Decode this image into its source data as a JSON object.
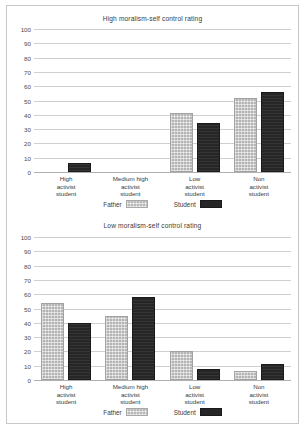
{
  "page": {
    "background_color": "#ffffff",
    "border_color": "#c8c8c8"
  },
  "legend": {
    "father_label": "Father",
    "student_label": "Student",
    "father_color": "#b4b4b4",
    "student_color": "#262626"
  },
  "charts": [
    {
      "id": "high-moralism",
      "title": "High moralism-self control rating",
      "yticks": [
        "100",
        "90",
        "80",
        "70",
        "60",
        "50",
        "40",
        "30",
        "20",
        "10",
        "0"
      ],
      "categories": [
        "High\nactivist\nstudent",
        "Medium high\nactivist\nstudent",
        "Low\nactivist\nstudent",
        "Non\nactivist\nstudent"
      ]
    },
    {
      "id": "low-moralism",
      "title": "Low moralism-self control rating",
      "yticks": [
        "100",
        "90",
        "80",
        "70",
        "60",
        "50",
        "40",
        "30",
        "20",
        "10",
        "0"
      ],
      "categories": [
        "High\nactivist\nstudent",
        "Medium high\nactivist\nstudent",
        "Low\nactivist\nstudent",
        "Non\nactivist\nstudent"
      ]
    }
  ],
  "chart_data": [
    {
      "type": "bar",
      "title": "High moralism-self control rating",
      "xlabel": "",
      "ylabel": "",
      "ylim": [
        0,
        100
      ],
      "yticks": [
        0,
        10,
        20,
        30,
        40,
        50,
        60,
        70,
        80,
        90,
        100
      ],
      "grid": true,
      "legend_position": "bottom",
      "categories": [
        "High activist student",
        "Medium high activist student",
        "Low activist student",
        "Non activist student"
      ],
      "series": [
        {
          "name": "Father",
          "color": "#b4b4b4",
          "values": [
            0,
            0,
            41,
            52
          ]
        },
        {
          "name": "Student",
          "color": "#262626",
          "values": [
            6,
            0,
            34,
            56
          ]
        }
      ]
    },
    {
      "type": "bar",
      "title": "Low moralism-self control rating",
      "xlabel": "",
      "ylabel": "",
      "ylim": [
        0,
        100
      ],
      "yticks": [
        0,
        10,
        20,
        30,
        40,
        50,
        60,
        70,
        80,
        90,
        100
      ],
      "grid": true,
      "legend_position": "bottom",
      "categories": [
        "High activist student",
        "Medium high activist student",
        "Low activist student",
        "Non activist student"
      ],
      "series": [
        {
          "name": "Father",
          "color": "#b4b4b4",
          "values": [
            54,
            45,
            20,
            6
          ]
        },
        {
          "name": "Student",
          "color": "#262626",
          "values": [
            40,
            58,
            8,
            11
          ]
        }
      ]
    }
  ]
}
